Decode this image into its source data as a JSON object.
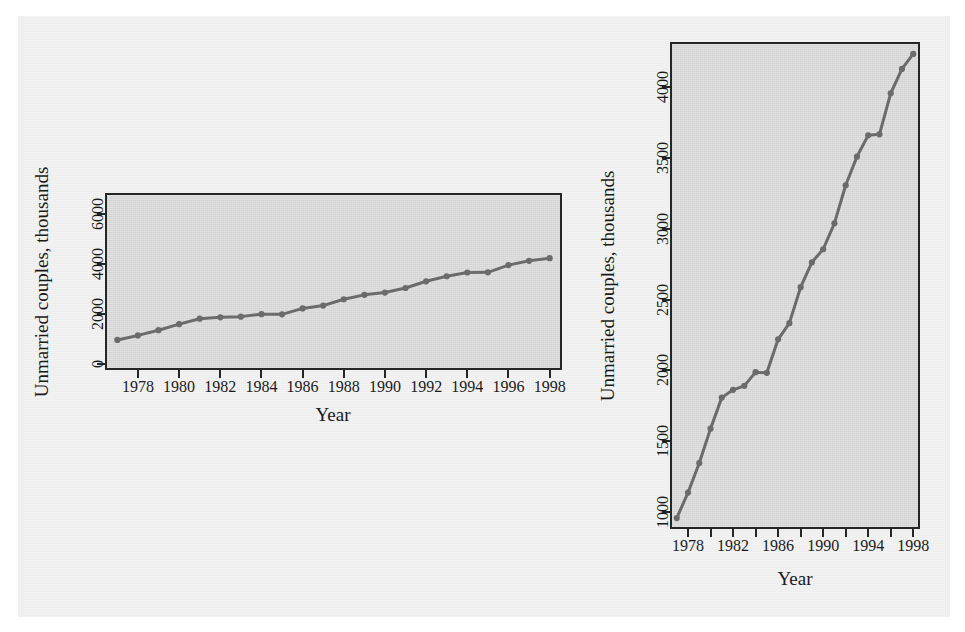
{
  "figure": {
    "background_color": "#ececec",
    "panel_background_color": "#d9d9d9",
    "axis_color": "#262626",
    "series_color": "#6b6b6b"
  },
  "chart_data": [
    {
      "id": "left-panel",
      "type": "line",
      "title": "",
      "xlabel": "Year",
      "ylabel": "Unmarried couples, thousands",
      "xlim": [
        1976.4,
        1998.6
      ],
      "ylim": [
        -250,
        6850
      ],
      "grid": false,
      "legend": "none",
      "markers": true,
      "xticks": [
        1978,
        1980,
        1982,
        1984,
        1986,
        1988,
        1990,
        1992,
        1994,
        1996,
        1998
      ],
      "xticklabels": [
        "1978",
        "1980",
        "1982",
        "1984",
        "1986",
        "1988",
        "1990",
        "1992",
        "1994",
        "1996",
        "1998"
      ],
      "yticks": [
        0,
        2000,
        4000,
        6000
      ],
      "yticklabels": [
        "0",
        "2000",
        "4000",
        "6000"
      ],
      "x": [
        1977,
        1978,
        1979,
        1980,
        1981,
        1982,
        1983,
        1984,
        1985,
        1986,
        1987,
        1988,
        1989,
        1990,
        1991,
        1992,
        1993,
        1994,
        1995,
        1996,
        1997,
        1998
      ],
      "values": [
        957,
        1137,
        1346,
        1589,
        1808,
        1863,
        1891,
        1988,
        1983,
        2220,
        2334,
        2588,
        2764,
        2856,
        3039,
        3308,
        3510,
        3661,
        3668,
        3958,
        4130,
        4236
      ]
    },
    {
      "id": "right-panel",
      "type": "line",
      "title": "",
      "xlabel": "Year",
      "ylabel": "Unmarried couples, thousands",
      "xlim": [
        1976.4,
        1998.6
      ],
      "ylim": [
        880,
        4320
      ],
      "grid": false,
      "legend": "none",
      "markers": true,
      "xticks": [
        1978,
        1980,
        1982,
        1984,
        1986,
        1988,
        1990,
        1992,
        1994,
        1996,
        1998
      ],
      "xticklabels": [
        "1978",
        "",
        "1982",
        "",
        "1986",
        "",
        "1990",
        "",
        "1994",
        "",
        "1998"
      ],
      "yticks": [
        1000,
        1500,
        2000,
        2500,
        3000,
        3500,
        4000
      ],
      "yticklabels": [
        "1000",
        "1500",
        "2000",
        "2500",
        "3000",
        "3500",
        "4000"
      ],
      "x": [
        1977,
        1978,
        1979,
        1980,
        1981,
        1982,
        1983,
        1984,
        1985,
        1986,
        1987,
        1988,
        1989,
        1990,
        1991,
        1992,
        1993,
        1994,
        1995,
        1996,
        1997,
        1998
      ],
      "values": [
        957,
        1137,
        1346,
        1589,
        1808,
        1863,
        1891,
        1988,
        1983,
        2220,
        2334,
        2588,
        2764,
        2856,
        3039,
        3308,
        3510,
        3661,
        3668,
        3958,
        4130,
        4236
      ]
    }
  ]
}
